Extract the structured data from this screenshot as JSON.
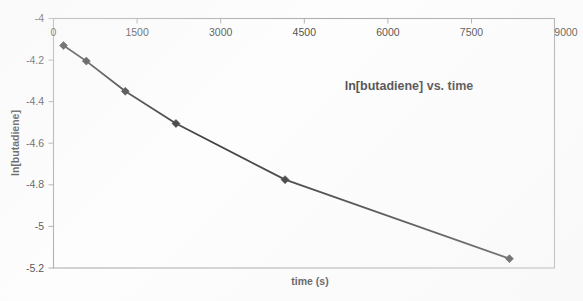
{
  "chart_data": {
    "type": "line",
    "title": "ln[butadiene] vs. time",
    "xlabel": "time (s)",
    "ylabel": "ln[butadiene]",
    "xlim": [
      0,
      9000
    ],
    "ylim": [
      -5.2,
      -4.0
    ],
    "xticks": [
      0,
      1500,
      3000,
      4500,
      6000,
      7500,
      9000
    ],
    "xtick_labels": [
      "0",
      "1500",
      "3000",
      "4500",
      "6000",
      "7500",
      "9000"
    ],
    "yticks": [
      -4.0,
      -4.2,
      -4.4,
      -4.6,
      -4.8,
      -5.0,
      -5.2
    ],
    "ytick_labels": [
      "-4",
      "-4.2",
      "-4.4",
      "-4.6",
      "-4.8",
      "-5",
      "-5.2"
    ],
    "grid": false,
    "legend": false,
    "x_axis_position": "top",
    "marker": "diamond",
    "line_color": "#111111",
    "marker_color": "#111111",
    "frame_color": "#9a9a9a",
    "series": [
      {
        "name": "ln[butadiene]",
        "x": [
          180,
          590,
          1290,
          2200,
          4160,
          8190
        ],
        "y": [
          -4.13,
          -4.205,
          -4.35,
          -4.505,
          -4.775,
          -5.155
        ]
      }
    ]
  },
  "annotations": {
    "title_text": "ln[butadiene] vs. time",
    "x_axis_caption": "time (s)",
    "y_axis_caption": "ln[butadiene]"
  }
}
